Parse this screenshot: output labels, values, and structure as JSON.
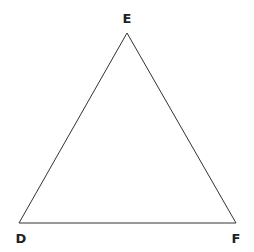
{
  "diagram": {
    "type": "triangle",
    "stroke_color": "#333333",
    "fill_color": "#ffffff",
    "vertices": [
      {
        "name": "E",
        "x": 127,
        "y": 33,
        "label_x": 127,
        "label_y": 23
      },
      {
        "name": "D",
        "x": 19,
        "y": 223,
        "label_x": 21,
        "label_y": 243
      },
      {
        "name": "F",
        "x": 236,
        "y": 223,
        "label_x": 236,
        "label_y": 243
      }
    ],
    "labels": {
      "top": "E",
      "bottom_left": "D",
      "bottom_right": "F"
    }
  }
}
